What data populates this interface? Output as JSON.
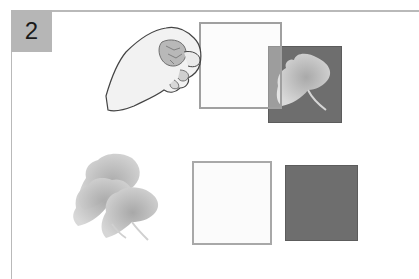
{
  "panel": {
    "number": "2",
    "badge_color": "#b6b6b6",
    "frame_color": "#b9b9b9"
  },
  "top_row": {
    "description": "Hand holding a translucent white sheet over a dark square containing a leaf shape",
    "hand": {
      "icon": "hand-holding-sheet-icon"
    },
    "white_sheet": {
      "color": "#fbfbfb",
      "border": "#a8a8a8"
    },
    "dark_square": {
      "color": "#6e6e6e"
    },
    "leaf": {
      "icon": "leaf-icon",
      "color": "#c8c8c8"
    }
  },
  "bottom_row": {
    "leaves": {
      "icon": "leaf-stack-icon",
      "count": 3,
      "color": "#c4c4c4"
    },
    "white_square": {
      "color": "#fbfbfb",
      "border": "#a8a8a8"
    },
    "dark_square": {
      "color": "#6e6e6e"
    }
  }
}
